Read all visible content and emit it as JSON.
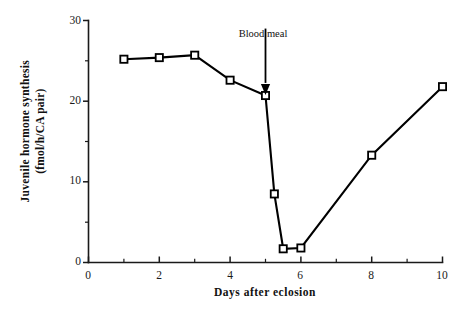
{
  "chart_data": {
    "type": "line",
    "title": "",
    "xlabel": "Days after eclosion",
    "ylabel": "Juvenile hormone synthesis (fmol/h/CA pair)",
    "ylabel_line1": "Juvenile  hormone  synthesis",
    "ylabel_line2": "(fmol/h/CA  pair)",
    "xlim": [
      0,
      10
    ],
    "ylim": [
      0,
      30
    ],
    "grid": false,
    "legend": "none",
    "marker": "open-square",
    "xticks": [
      0,
      2,
      4,
      6,
      8,
      10
    ],
    "xtick_labels": [
      "0",
      "2",
      "4",
      "6",
      "8",
      "10"
    ],
    "xminor_ticks": [
      1,
      3,
      5,
      7,
      9
    ],
    "yticks": [
      0,
      10,
      20,
      30
    ],
    "ytick_labels": [
      "0",
      "10",
      "20",
      "30"
    ],
    "yminor_ticks": [
      5,
      15,
      25
    ],
    "x": [
      1,
      2,
      3,
      4,
      5,
      5.25,
      5.5,
      6,
      8,
      10
    ],
    "values": [
      25.2,
      25.4,
      25.7,
      22.6,
      20.7,
      8.5,
      1.7,
      1.8,
      13.3,
      21.8
    ],
    "annotations": [
      {
        "text": "Blood meal",
        "x": 5,
        "arrow": "down",
        "arrow_from_y": 29.0,
        "arrow_to_y": 23.5
      }
    ]
  },
  "xaxis": {
    "title": "Days after eclosion",
    "labels": [
      "0",
      "2",
      "4",
      "6",
      "8",
      "10"
    ]
  },
  "yaxis": {
    "title_line1": "Juvenile  hormone  synthesis",
    "title_line2": "(fmol/h/CA  pair)",
    "labels": [
      "0",
      "10",
      "20",
      "30"
    ]
  },
  "annotation": {
    "label": "Blood meal"
  }
}
